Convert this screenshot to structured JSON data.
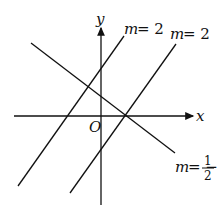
{
  "diagram": {
    "axes": {
      "x_label": "x",
      "y_label": "y",
      "origin_label": "O"
    },
    "lines": [
      {
        "name": "line-slope-2-left",
        "label_m": "m",
        "label_eq": "= 2",
        "slope": 2
      },
      {
        "name": "line-slope-2-right",
        "label_m": "m",
        "label_eq": "= 2",
        "slope": 2
      },
      {
        "name": "line-slope-neg-half",
        "label_m": "m",
        "label_eq": "= −",
        "slope_num": "1",
        "slope_den": "2",
        "slope": -0.5
      }
    ],
    "colors": {
      "stroke": "#111111",
      "background": "#ffffff"
    }
  }
}
